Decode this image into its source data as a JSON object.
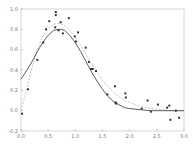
{
  "chart_data": {
    "type": "scatter",
    "title": "",
    "xlabel": "",
    "ylabel": "",
    "xlim": [
      0.0,
      3.0
    ],
    "ylim": [
      -0.2,
      1.0
    ],
    "grid": false,
    "x_ticks": [
      "0.0",
      "0.5",
      "1.0",
      "1.5",
      "2.0",
      "2.5",
      "3.0"
    ],
    "y_ticks": [
      "1.0",
      "0.8",
      "0.6",
      "0.4",
      "0.2",
      "0.0",
      "-0.2"
    ],
    "series": [
      {
        "name": "data points",
        "type": "scatter",
        "x": [
          0.02,
          0.13,
          0.3,
          0.41,
          0.46,
          0.52,
          0.64,
          0.64,
          0.63,
          0.69,
          0.73,
          0.77,
          0.88,
          0.99,
          1.01,
          1.05,
          1.19,
          1.25,
          1.29,
          1.32,
          1.38,
          1.59,
          1.73,
          1.74,
          1.75,
          1.92,
          1.93,
          2.22,
          2.33,
          2.39,
          2.52,
          2.69,
          2.73,
          2.75,
          2.85,
          2.91
        ],
        "y": [
          -0.03,
          0.21,
          0.5,
          0.67,
          0.8,
          0.88,
          0.97,
          0.94,
          0.82,
          0.79,
          0.87,
          0.76,
          0.91,
          0.73,
          0.68,
          0.77,
          0.62,
          0.48,
          0.41,
          0.41,
          0.39,
          0.16,
          0.24,
          0.08,
          0.07,
          0.17,
          0.13,
          0.02,
          0.1,
          -0.01,
          0.06,
          0.03,
          0.05,
          -0.09,
          0.0,
          -0.07
        ]
      },
      {
        "name": "solid fit",
        "type": "line",
        "style": "solid",
        "x": [
          0.0,
          0.1,
          0.2,
          0.3,
          0.4,
          0.5,
          0.6,
          0.7,
          0.8,
          0.9,
          1.0,
          1.1,
          1.2,
          1.3,
          1.4,
          1.5,
          1.6,
          1.7,
          1.8,
          1.9,
          2.0,
          2.2,
          2.4,
          2.6,
          2.8,
          3.0
        ],
        "y": [
          0.31,
          0.39,
          0.48,
          0.58,
          0.67,
          0.74,
          0.79,
          0.8,
          0.79,
          0.74,
          0.67,
          0.58,
          0.48,
          0.38,
          0.29,
          0.21,
          0.14,
          0.09,
          0.06,
          0.03,
          0.02,
          0.01,
          0.0,
          0.0,
          0.0,
          0.0
        ]
      },
      {
        "name": "dashed fit",
        "type": "line",
        "style": "dashed",
        "x": [
          0.0,
          0.1,
          0.2,
          0.3,
          0.4,
          0.5,
          0.6,
          0.7,
          0.8,
          0.9,
          1.0,
          1.1,
          1.2,
          1.3,
          1.4,
          1.5,
          1.6,
          1.7,
          1.8,
          1.9,
          2.0,
          2.2,
          2.4,
          2.6,
          2.8,
          3.0
        ],
        "y": [
          0.0,
          0.2,
          0.42,
          0.6,
          0.73,
          0.81,
          0.85,
          0.86,
          0.84,
          0.79,
          0.72,
          0.64,
          0.55,
          0.46,
          0.38,
          0.3,
          0.24,
          0.18,
          0.14,
          0.1,
          0.08,
          0.04,
          0.02,
          0.01,
          0.0,
          0.0
        ]
      }
    ]
  }
}
